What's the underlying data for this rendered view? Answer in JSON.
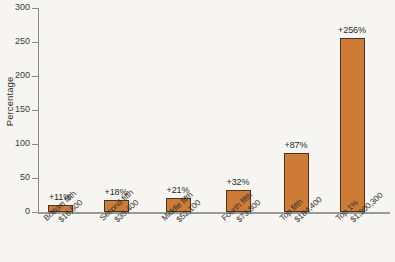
{
  "chart_data": {
    "type": "bar",
    "title": "",
    "xlabel": "",
    "ylabel": "Percentage",
    "ylim": [
      0,
      300
    ],
    "yticks": [
      0,
      50,
      100,
      150,
      200,
      250,
      300
    ],
    "grid": false,
    "legend": null,
    "categories": [
      "Bottom fifth",
      "Second fifth",
      "Middle fifth",
      "Fourth fifth",
      "Top fifth",
      "Top 1%"
    ],
    "category_sublabels": [
      "$16,500",
      "$35,400",
      "$52,100",
      "$73,800",
      "$184,400",
      "$1,200,300"
    ],
    "values": [
      11,
      18,
      21,
      32,
      87,
      256
    ],
    "data_labels": [
      "+11%",
      "+18%",
      "+21%",
      "+32%",
      "+87%",
      "+256%"
    ],
    "bar_color": "#cd7b36",
    "bar_edge_color": "#4a3320",
    "axis_color": "#8a8a86",
    "background_color": "#f6f5f1"
  }
}
